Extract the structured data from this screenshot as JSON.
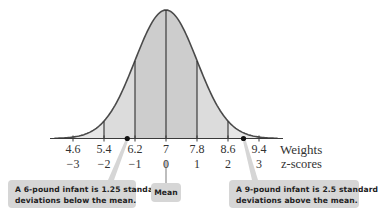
{
  "chart_data": {
    "type": "area",
    "title": "",
    "mean": 7,
    "std_dev": 0.8,
    "xlabel": "Weights",
    "x2label": "z-scores",
    "weights_ticks": [
      "4.6",
      "5.4",
      "6.2",
      "7",
      "7.8",
      "8.6",
      "9.4"
    ],
    "z_ticks": [
      "−3",
      "−2",
      "−1",
      "0",
      "1",
      "2",
      "3"
    ],
    "tick_values": [
      4.6,
      5.4,
      6.2,
      7,
      7.8,
      8.6,
      9.4
    ],
    "z_values": [
      -3,
      -2,
      -1,
      0,
      1,
      2,
      3
    ],
    "grid": false,
    "highlighted_points": [
      {
        "weight": 6,
        "z": -1.25,
        "label": "A 6-pound infant is 1.25 standard deviations below the mean."
      },
      {
        "weight": 9,
        "z": 2.5,
        "label": "A 9-pound infant is 2.5 standard deviations above the mean."
      }
    ],
    "shading": [
      {
        "from_z": -1,
        "to_z": 1,
        "color": "#cdcdcd"
      },
      {
        "from_z": -2,
        "to_z": -1,
        "color": "#dcdcdc"
      },
      {
        "from_z": 1,
        "to_z": 2,
        "color": "#dcdcdc"
      },
      {
        "from_z": -3,
        "to_z": -2,
        "color": "#e6e6e6"
      },
      {
        "from_z": 2,
        "to_z": 3,
        "color": "#e6e6e6"
      }
    ]
  },
  "labels": {
    "weights_axis": "Weights",
    "z_axis": "z-scores",
    "mean_callout": "Mean",
    "left_callout_line1": "A 6-pound infant is 1.25 standard",
    "left_callout_line2": "deviations below the mean.",
    "right_callout_line1": "A 9-pound infant is 2.5 standard",
    "right_callout_line2": "deviations above the mean."
  },
  "colors": {
    "curve": "#4a4a4a",
    "axis": "#3a3a3a",
    "callout_bg": "#d6d6d6",
    "center_fill": "#cdcdcd",
    "mid_fill": "#dcdcdc",
    "tail_fill": "#e6e6e6"
  }
}
